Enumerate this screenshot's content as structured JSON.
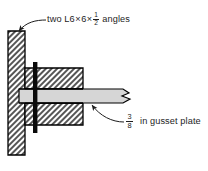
{
  "drawing": {
    "title": "Bolted double-angle to gusset plate connection detail",
    "type": "engineering-section-detail",
    "background_color": "#ffffff"
  },
  "annotations": {
    "angles": {
      "prefix": "two L6",
      "times_1": "×",
      "dim_2": "6",
      "times_2": "×",
      "fraction_numerator": "1",
      "fraction_denominator": "2",
      "suffix": "angles",
      "full_text": "two L6 × 6 × 1/2 angles",
      "leader": "curved-arrow-to-upper-angle-leg"
    },
    "gusset": {
      "fraction_numerator": "3",
      "fraction_denominator": "8",
      "suffix": "in gusset plate",
      "full_text": "3/8 in gusset plate",
      "leader": "curved-arrow-to-gusset-plate"
    }
  },
  "components": {
    "angle_vertical_leg": {
      "name": "double-angle-vertical-leg",
      "fill": "hatched",
      "hatch_color": "#3a3a3a",
      "outline_color": "#000000"
    },
    "angle_horizontal_leg_top": {
      "name": "double-angle-horizontal-leg-upper",
      "fill": "hatched"
    },
    "angle_horizontal_leg_bottom": {
      "name": "double-angle-horizontal-leg-lower",
      "fill": "hatched"
    },
    "gusset_plate": {
      "name": "gusset-plate",
      "fill_color": "#d6d6d6",
      "outline_color": "#000000",
      "right_end": "break-line-zigzag"
    },
    "bolt_line": {
      "name": "bolt-line",
      "fill_color": "#0a0a0a",
      "orientation": "vertical"
    }
  }
}
